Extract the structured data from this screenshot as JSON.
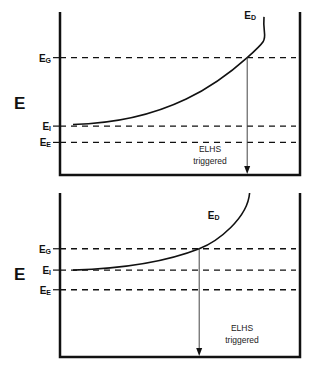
{
  "panels": [
    {
      "id": "top",
      "axis_label": "E",
      "levels": [
        {
          "name": "E_G",
          "main": "E",
          "sub": "G",
          "value": 0.72
        },
        {
          "name": "E_I",
          "main": "E",
          "sub": "I",
          "value": 0.3
        },
        {
          "name": "E_E",
          "main": "E",
          "sub": "E",
          "value": 0.2
        }
      ],
      "curve_label": {
        "main": "E",
        "sub": "D"
      },
      "annotation": [
        "ELHS",
        "triggered"
      ],
      "curve_start_level": 0.31,
      "curve_end_level": 0.97,
      "crossing_fraction": 0.78,
      "curve_end_fraction": 0.85
    },
    {
      "id": "bottom",
      "axis_label": "E",
      "levels": [
        {
          "name": "E_G",
          "main": "E",
          "sub": "G",
          "value": 0.66
        },
        {
          "name": "E_I",
          "main": "E",
          "sub": "I",
          "value": 0.53
        },
        {
          "name": "E_E",
          "main": "E",
          "sub": "E",
          "value": 0.41
        }
      ],
      "curve_label": {
        "main": "E",
        "sub": "D"
      },
      "annotation": [
        "ELHS",
        "triggered"
      ],
      "curve_start_level": 0.53,
      "curve_end_level": 1.0,
      "crossing_fraction": 0.58,
      "curve_end_fraction": 0.79
    }
  ]
}
